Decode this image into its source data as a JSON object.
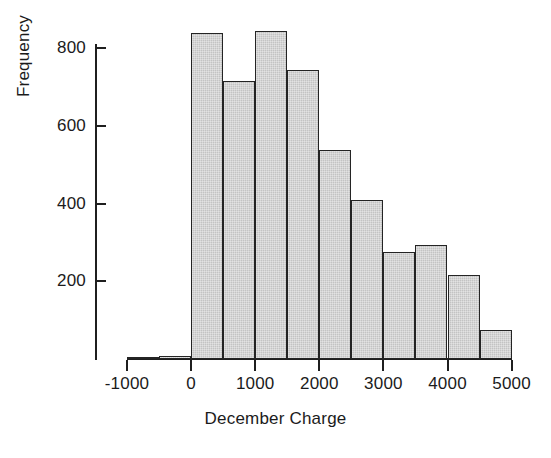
{
  "chart_data": {
    "type": "bar",
    "title": "",
    "subtitle": "",
    "xlabel": "December Charge",
    "ylabel": "Frequency",
    "grid": false,
    "legend": null,
    "legend_position": "none",
    "bin_width": 500,
    "bin_edges": [
      -1000,
      -500,
      0,
      500,
      1000,
      1500,
      2000,
      2500,
      3000,
      3500,
      4000,
      4500,
      5000
    ],
    "categories": [
      "-1000 to -500",
      "-500 to 0",
      "0 to 500",
      "500 to 1000",
      "1000 to 1500",
      "1500 to 2000",
      "2000 to 2500",
      "2500 to 3000",
      "3000 to 3500",
      "3500 to 4000",
      "4000 to 4500",
      "4500 to 5000"
    ],
    "values": [
      3,
      8,
      840,
      716,
      845,
      744,
      538,
      409,
      275,
      293,
      216,
      75
    ],
    "xlim": [
      -1000,
      5000
    ],
    "ylim": [
      0,
      900
    ],
    "xticks": [
      -1000,
      0,
      1000,
      2000,
      3000,
      4000,
      5000
    ],
    "xtick_labels": [
      "-1000",
      "0",
      "1000",
      "2000",
      "3000",
      "4000",
      "5000"
    ],
    "yticks": [
      200,
      400,
      600,
      800
    ],
    "ytick_labels": [
      "200",
      "400",
      "600",
      "800"
    ],
    "bar_fill_color": "#c9c9c9",
    "bar_edge_color": "#242424",
    "axis_color": "#1f1f1f",
    "text_color": "#1b1b1b",
    "background_color": "#ffffff"
  }
}
